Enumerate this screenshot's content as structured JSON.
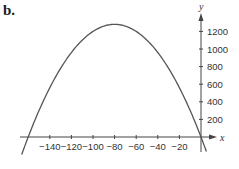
{
  "panel_label": "b.",
  "chart_data": {
    "type": "line",
    "title": "",
    "xlabel": "x",
    "ylabel": "y",
    "function": "y = -0.2x(x + 160)",
    "x": [
      -165,
      -160,
      -140,
      -120,
      -100,
      -80,
      -60,
      -40,
      -20,
      0,
      5
    ],
    "series": [
      {
        "name": "parabola",
        "values": [
          -165,
          0,
          560,
          960,
          1200,
          1280,
          1200,
          960,
          560,
          0,
          -165
        ]
      }
    ],
    "x_ticks": [
      -140,
      -120,
      -100,
      -80,
      -60,
      -40,
      -20
    ],
    "x_tick_labels": [
      "−140",
      "−120",
      "−100",
      "−80",
      "−60",
      "−40",
      "−20"
    ],
    "y_ticks": [
      200,
      400,
      600,
      800,
      1000,
      1200
    ],
    "y_tick_labels": [
      "200",
      "400",
      "600",
      "800",
      "1000",
      "1200"
    ],
    "xlim": [
      -165,
      10
    ],
    "ylim": [
      -250,
      1400
    ],
    "vertex": {
      "x": -80,
      "y": 1280
    },
    "roots": [
      -160,
      0
    ],
    "grid": false,
    "legend": null,
    "colors": {
      "curve": "#555555",
      "axes": "#444444"
    }
  }
}
